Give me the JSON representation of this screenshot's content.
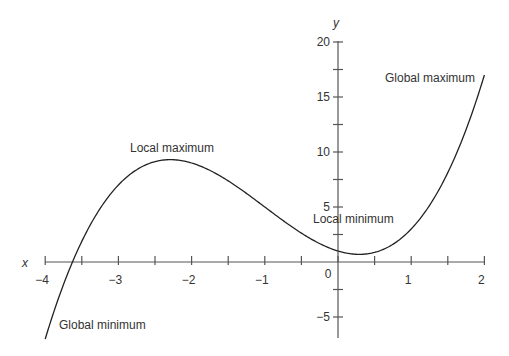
{
  "chart_data": {
    "type": "line",
    "title": "",
    "xlabel": "x",
    "ylabel": "y",
    "xlim": [
      -4,
      2
    ],
    "ylim": [
      -7,
      20
    ],
    "grid": false,
    "function": "y = x^3 + 3x^2 - 2x + 1",
    "x_ticks": [
      -4,
      -3.5,
      -3,
      -2.5,
      -2,
      -1.5,
      -1,
      -0.5,
      0,
      0.5,
      1,
      1.5,
      2
    ],
    "x_tick_labels": [
      "−4",
      "−3",
      "−2",
      "−1",
      "0",
      "1",
      "2"
    ],
    "x_tick_label_values": [
      -4,
      -3,
      -2,
      -1,
      0,
      1,
      2
    ],
    "y_ticks": [
      -5,
      -2.5,
      2.5,
      5,
      7.5,
      10,
      12.5,
      15,
      17.5,
      20
    ],
    "y_tick_labels": [
      "20",
      "15",
      "10",
      "5",
      "−5"
    ],
    "y_tick_label_values": [
      20,
      15,
      10,
      5,
      -5
    ],
    "series": [
      {
        "name": "f(x)",
        "x": [
          -4,
          -3.75,
          -3.5,
          -3,
          -2.5,
          -2.29,
          -2,
          -1.5,
          -1,
          -0.5,
          0,
          0.29,
          0.5,
          1,
          1.5,
          2
        ],
        "values": [
          -7,
          -2,
          1.63,
          7,
          9.13,
          9.3,
          9,
          7.38,
          5,
          2.88,
          1,
          0.69,
          0.88,
          3,
          7.38,
          17
        ]
      }
    ],
    "annotations": [
      {
        "text": "Global maximum",
        "x": 2,
        "y": 17
      },
      {
        "text": "Local maximum",
        "x": -2.29,
        "y": 9.3
      },
      {
        "text": "Local minimum",
        "x": 0.29,
        "y": 0.69
      },
      {
        "text": "Global minimum",
        "x": -4,
        "y": -7
      }
    ]
  }
}
